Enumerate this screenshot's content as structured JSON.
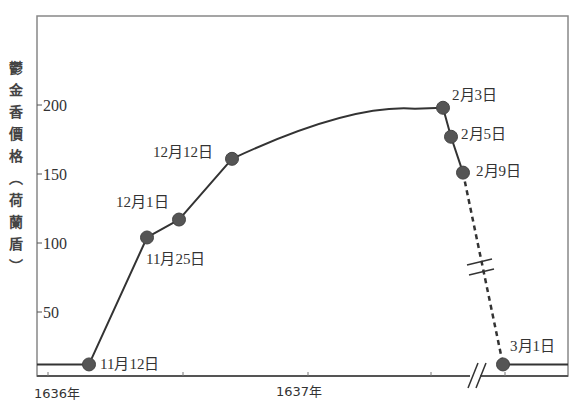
{
  "chart_data": {
    "type": "line",
    "title": "",
    "ylabel": "鬱金香價格（荷蘭盾）",
    "xlabel": "",
    "ylim": [
      0,
      250
    ],
    "y_ticks": [
      50,
      100,
      150,
      200
    ],
    "y_tick_labels": [
      "50",
      "100",
      "150",
      "200"
    ],
    "x_tick_labels": [
      "1636年",
      "1637年"
    ],
    "grid": false,
    "legend": "none",
    "baseline_value": 12,
    "axis_break": true,
    "series": [
      {
        "name": "鬱金香價格",
        "points": [
          {
            "label": "11月12日",
            "value": 12
          },
          {
            "label": "11月25日",
            "value": 104
          },
          {
            "label": "12月1日",
            "value": 117
          },
          {
            "label": "12月12日",
            "value": 161
          },
          {
            "label": "2月3日",
            "value": 198
          },
          {
            "label": "2月5日",
            "value": 177
          },
          {
            "label": "2月9日",
            "value": 151
          },
          {
            "label": "3月1日",
            "value": 12
          }
        ],
        "dashed_segment": [
          "2月9日",
          "3月1日"
        ]
      }
    ]
  }
}
